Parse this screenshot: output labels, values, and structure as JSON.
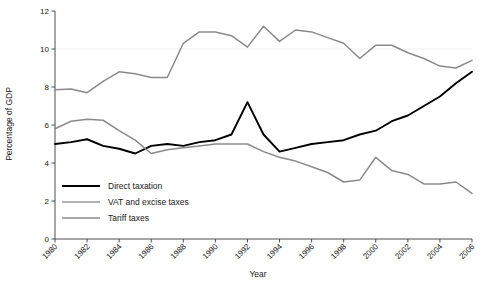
{
  "chart_data": {
    "type": "line",
    "title": "",
    "xlabel": "Year",
    "ylabel": "Percentage of GDP",
    "xlim": [
      1980,
      2006
    ],
    "ylim": [
      0,
      12
    ],
    "yticks": [
      0,
      2,
      4,
      6,
      8,
      10,
      12
    ],
    "xticks": [
      1980,
      1982,
      1984,
      1986,
      1988,
      1990,
      1992,
      1994,
      1996,
      1998,
      2000,
      2002,
      2004,
      2006
    ],
    "xtick_labels": [
      "1980",
      "1982",
      "1984",
      "1986",
      "1988",
      "1990",
      "1992",
      "1994",
      "1996",
      "1998",
      "2000",
      "2002",
      "2004",
      "2006"
    ],
    "ytick_labels": [
      "0",
      "2",
      "4",
      "6",
      "8",
      "10",
      "12"
    ],
    "grid": false,
    "legend_position": "inside lower-left",
    "x": [
      1980,
      1981,
      1982,
      1983,
      1984,
      1985,
      1986,
      1987,
      1988,
      1989,
      1990,
      1991,
      1992,
      1993,
      1994,
      1995,
      1996,
      1997,
      1998,
      1999,
      2000,
      2001,
      2002,
      2003,
      2004,
      2005,
      2006
    ],
    "series": [
      {
        "name": "Direct taxation",
        "color": "#000000",
        "width": 1.9,
        "values": [
          5.0,
          5.1,
          5.25,
          4.9,
          4.75,
          4.5,
          4.9,
          5.0,
          4.9,
          5.1,
          5.2,
          5.5,
          7.2,
          5.5,
          4.6,
          4.8,
          5.0,
          5.1,
          5.2,
          5.5,
          5.7,
          6.2,
          6.5,
          7.0,
          7.5,
          8.2,
          8.8
        ]
      },
      {
        "name": "VAT and excise taxes",
        "color": "#8a8a8a",
        "width": 1.5,
        "values": [
          5.8,
          6.2,
          6.3,
          6.25,
          5.7,
          5.2,
          4.5,
          4.7,
          4.8,
          4.9,
          5.0,
          5.0,
          5.0,
          4.6,
          4.3,
          4.1,
          3.8,
          3.5,
          3.0,
          3.1,
          4.3,
          3.6,
          3.4,
          2.9,
          2.9,
          3.0,
          2.4
        ]
      },
      {
        "name": "Tariff taxes",
        "color": "#8a8a8a",
        "width": 1.5,
        "values": [
          7.85,
          7.9,
          7.7,
          8.3,
          8.8,
          8.7,
          8.5,
          8.5,
          10.3,
          10.9,
          10.9,
          10.7,
          10.1,
          11.2,
          10.4,
          11.0,
          10.9,
          10.6,
          10.3,
          9.5,
          10.2,
          10.2,
          9.8,
          9.5,
          9.1,
          9.0,
          9.4
        ]
      }
    ],
    "legend": [
      {
        "label": "Direct taxation",
        "color": "#000000",
        "width": 2.2
      },
      {
        "label": "VAT and excise taxes",
        "color": "#9a9a9a",
        "width": 1.5
      },
      {
        "label": "Tariff taxes",
        "color": "#8a8a8a",
        "width": 1.7
      }
    ]
  },
  "colors": {
    "axis": "#4d4d4d",
    "text": "#1a1a1a",
    "background": "#ffffff",
    "direct": "#000000",
    "vat": "#8a8a8a",
    "tariff": "#8a8a8a"
  }
}
